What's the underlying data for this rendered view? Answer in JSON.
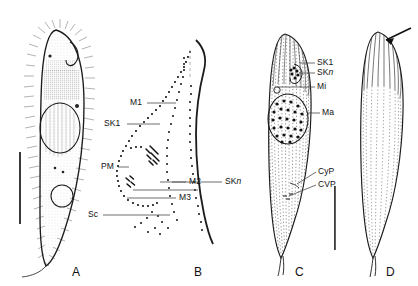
{
  "figure": {
    "type": "scientific-plate",
    "caption_fragment_top": "",
    "background": "#ffffff",
    "ink_color": "#1b1b1b",
    "panels": [
      {
        "id": "A",
        "letter": "A",
        "view": "ventral-view-live-cell",
        "description": "Ciliate cell drawn from life, densely ciliated, with macronucleus, contractile vacuole and tail-like posterior",
        "labels": [],
        "scale_bar": {
          "name": "scale-bar-a",
          "orientation": "vertical"
        }
      },
      {
        "id": "B",
        "letter": "B",
        "view": "oral-infraciliature-detail",
        "description": "Detail of the anterior ventral infraciliature showing membranelles and kineties",
        "labels": [
          {
            "key": "M1",
            "text": "M1"
          },
          {
            "key": "SK1",
            "text": "SK1"
          },
          {
            "key": "PM",
            "text": "PM"
          },
          {
            "key": "M2",
            "text": "M2"
          },
          {
            "key": "M3",
            "text": "M3"
          },
          {
            "key": "Sc",
            "text": "Sc"
          },
          {
            "key": "SKn",
            "text": "SKn",
            "italic_tail": "n"
          }
        ],
        "scale_bar": null
      },
      {
        "id": "C",
        "letter": "C",
        "view": "ventral-infraciliature-and-nuclear-apparatus",
        "description": "Whole cell, ventral side, showing somatic kineties, nuclear apparatus, cytopyge and contractile vacuole pore",
        "labels": [
          {
            "key": "SK1",
            "text": "SK1"
          },
          {
            "key": "SKn",
            "text": "SKn",
            "italic_tail": "n"
          },
          {
            "key": "Mi",
            "text": "Mi"
          },
          {
            "key": "Ma",
            "text": "Ma"
          },
          {
            "key": "CyP",
            "text": "CyP"
          },
          {
            "key": "CVP",
            "text": "CVP"
          }
        ],
        "scale_bar": {
          "name": "scale-bar-cd",
          "orientation": "vertical"
        }
      },
      {
        "id": "D",
        "letter": "D",
        "view": "dorsal-infraciliature",
        "description": "Whole cell, dorsal side, showing dorsal kineties; arrow marks the anterior end",
        "labels": [],
        "annotations": [
          {
            "key": "arrow",
            "text": "",
            "name": "dorsal-arrow"
          }
        ],
        "scale_bar": null
      }
    ],
    "legend_abbreviations": [
      {
        "abbr": "M1",
        "meaning": "membranelle 1"
      },
      {
        "abbr": "M2",
        "meaning": "membranelle 2"
      },
      {
        "abbr": "M3",
        "meaning": "membranelle 3"
      },
      {
        "abbr": "SK1",
        "meaning": "somatic kinety 1"
      },
      {
        "abbr": "SKn",
        "meaning": "somatic kinety n"
      },
      {
        "abbr": "PM",
        "meaning": "paroral membrane"
      },
      {
        "abbr": "Sc",
        "meaning": "scutica"
      },
      {
        "abbr": "Ma",
        "meaning": "macronucleus"
      },
      {
        "abbr": "Mi",
        "meaning": "micronucleus"
      },
      {
        "abbr": "CyP",
        "meaning": "cytopyge"
      },
      {
        "abbr": "CVP",
        "meaning": "contractile vacuole pore"
      }
    ]
  }
}
